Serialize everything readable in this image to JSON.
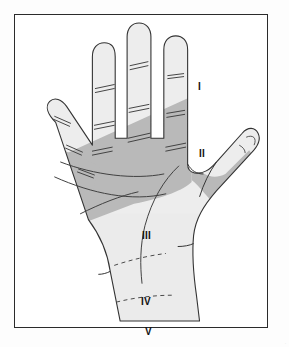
{
  "figure": {
    "kind": "anatomical-diagram",
    "view": "palmar (volar) view",
    "frame": {
      "border_color": "#2b2b2b",
      "background_color": "#ffffff",
      "page_background": "#fdfdfd"
    },
    "colors": {
      "outline": "#333333",
      "crease_line": "#444444",
      "skin_light": "#eeeeee",
      "skin_mid": "#e4e4e4",
      "skin_shaded": "#b9b9b9",
      "label_text": "#111111",
      "watermark": "#e4e4e4"
    },
    "zones": [
      {
        "id": "I",
        "label": "I",
        "description": "distal phalangeal region of digits (unshaded zone)"
      },
      {
        "id": "II",
        "label": "II",
        "description": "proximal / middle phalangeal and distal palm region (shaded zone)"
      },
      {
        "id": "III",
        "label": "III",
        "description": "mid palm region"
      },
      {
        "id": "IV",
        "label": "IV",
        "description": "proximal palm region"
      },
      {
        "id": "V",
        "label": "V",
        "description": "wrist / carpal region"
      }
    ],
    "markings": {
      "finger_creases": "paired short transverse lines at interphalangeal flexion creases",
      "palmar_creases": "curved solid lines across the palm",
      "zone_boundaries": "dashed horizontal lines separating zones III, IV and V"
    },
    "watermark": "·"
  }
}
